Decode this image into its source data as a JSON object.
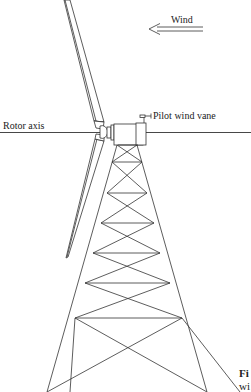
{
  "diagram": {
    "labels": {
      "wind": "Wind",
      "rotor_axis": "Rotor axis",
      "pilot_wind_vane": "Pilot wind vane"
    },
    "caption": {
      "prefix": "Fi",
      "line2": "wi"
    },
    "colors": {
      "line": "#333333",
      "background": "#ffffff"
    }
  }
}
